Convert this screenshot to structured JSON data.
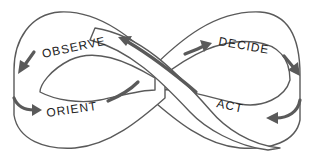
{
  "diagram": {
    "type": "OODA loop (figure-eight / infinity band)",
    "labels": {
      "observe": "OBSERVE",
      "orient": "ORIENT",
      "decide": "DECIDE",
      "act": "ACT"
    },
    "flow": [
      "OBSERVE",
      "ORIENT",
      "DECIDE",
      "ACT"
    ],
    "colors": {
      "stroke": "#5a5a5a",
      "text": "#222222",
      "background": "#ffffff"
    }
  }
}
